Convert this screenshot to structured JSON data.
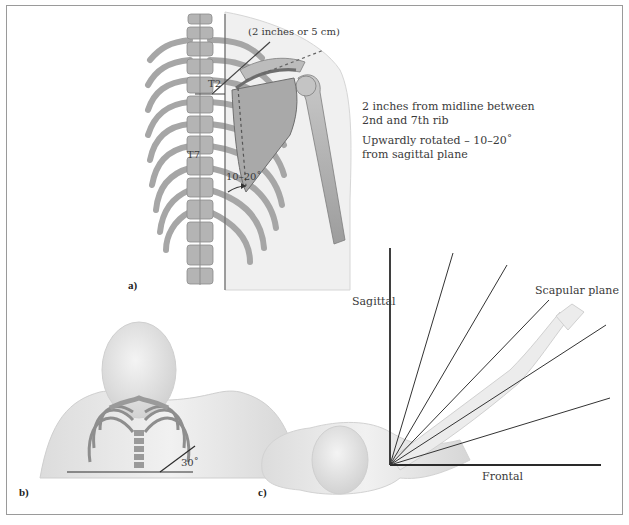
{
  "figure": {
    "panels": [
      {
        "id": "a",
        "label": "a)",
        "annotations": {
          "distance": "(2 inches or 5 cm)",
          "vertebra_upper": "T2",
          "vertebra_lower": "T7",
          "angle": "10–20˚",
          "note_position": "2 inches from midline between",
          "note_position_2": "2nd and 7th rib",
          "note_rotation": "Upwardly rotated – 10–20˚",
          "note_rotation_2": "from sagittal plane"
        }
      },
      {
        "id": "b",
        "label": "b)",
        "annotations": {
          "angle": "30˚"
        }
      },
      {
        "id": "c",
        "label": "c)",
        "annotations": {
          "axis_vertical": "Sagittal",
          "axis_horizontal": "Frontal",
          "highlighted_plane": "Scapular plane"
        }
      }
    ]
  },
  "colors": {
    "frame": "#9a9a9a",
    "bone": "#b9b9b9",
    "bone_dark": "#7d7d7d",
    "skin": "#e6e6e6",
    "line": "#3a3a3a"
  }
}
